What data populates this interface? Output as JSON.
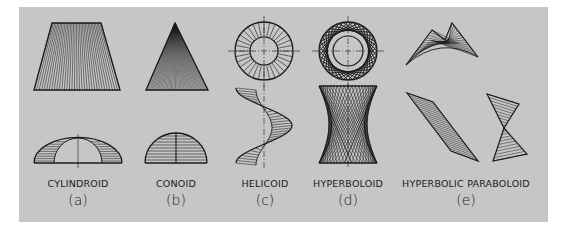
{
  "figure": {
    "background": "#c6c6c6",
    "ink": "#1a1a1a",
    "items": [
      {
        "name": "CYLINDROID",
        "letter": "(a)",
        "cx": 78
      },
      {
        "name": "CONOID",
        "letter": "(b)",
        "cx": 176
      },
      {
        "name": "HELICOID",
        "letter": "(c)",
        "cx": 265
      },
      {
        "name": "HYPERBOLOID",
        "letter": "(d)",
        "cx": 348
      },
      {
        "name": "HYPERBOLIC PARABOLOID",
        "letter": "(e)",
        "cx": 466
      }
    ]
  }
}
